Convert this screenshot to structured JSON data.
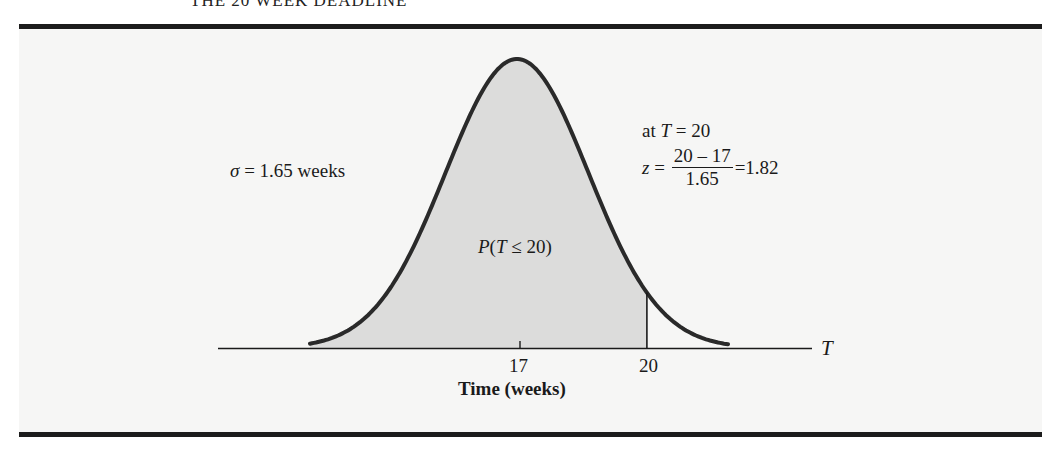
{
  "header": {
    "title": "THE 20 WEEK DEADLINE"
  },
  "annotations": {
    "sigma_symbol": "σ",
    "sigma_text": " = 1.65 weeks",
    "at_prefix": "at ",
    "at_var": "T",
    "at_suffix": " = 20",
    "z_var": "z",
    "z_eq": " = ",
    "z_numerator": "20 – 17",
    "z_denominator": "1.65",
    "z_result": "=1.82",
    "prob_P": "P",
    "prob_open": "(",
    "prob_var": "T",
    "prob_rest": " ≤ 20)"
  },
  "axis": {
    "var_label": "T",
    "ticks": [
      "17",
      "20"
    ],
    "xlabel": "Time (weeks)"
  },
  "colors": {
    "curve": "#2a2a2a",
    "shade": "#dcdcdb",
    "panel": "#f6f6f5",
    "rule": "#1c1c1c"
  },
  "chart_data": {
    "type": "area",
    "title": "",
    "subtitle": "Normal distribution of completion time",
    "distribution": "normal",
    "mean": 17,
    "std_dev": 1.65,
    "shaded_region": {
      "from": "-inf",
      "to": 20,
      "label": "P(T ≤ 20)"
    },
    "x_ticks": [
      17,
      20
    ],
    "xlabel": "Time (weeks)",
    "axis_variable": "T",
    "annotations": [
      "σ = 1.65 weeks",
      "at T = 20",
      "z = (20 – 17)/1.65 = 1.82",
      "P(T ≤ 20)"
    ],
    "z_value": 1.82,
    "grid": false,
    "legend": "none"
  }
}
